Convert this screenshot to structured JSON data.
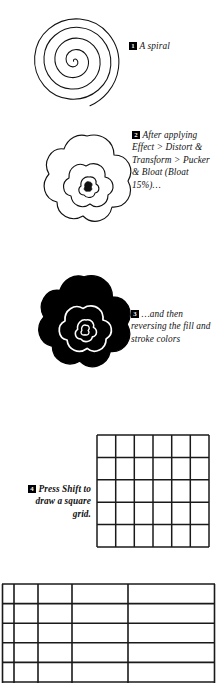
{
  "page": {
    "background_color": "#ffffff",
    "ink_color": "#111111",
    "width": 217,
    "height": 680
  },
  "figures": [
    {
      "id": "figure-spiral",
      "name": "spiral-figure",
      "description": "open outlined spiral curve, black stroke on white",
      "fill": "none",
      "stroke": "#111111"
    },
    {
      "id": "figure-bloat",
      "name": "bloated-spiral-figure",
      "description": "spiral after Pucker & Bloat effect, flower-like outline, white fill with black stroke",
      "fill": "#ffffff",
      "stroke": "#111111"
    },
    {
      "id": "figure-reversed",
      "name": "reversed-colors-figure",
      "description": "same bloated shape with fill and stroke colors reversed, black fill with white stroke",
      "fill": "#000000",
      "stroke": "#ffffff"
    },
    {
      "id": "figure-square-grid",
      "name": "square-grid-figure",
      "description": "square grid drawn with Shift held",
      "columns": 6,
      "rows": 5,
      "stroke": "#1a1a1a"
    },
    {
      "id": "figure-wide-grid",
      "name": "wide-grid-figure",
      "description": "non-square stretched grid with unequal column widths",
      "columns": 5,
      "rows": 5,
      "column_ratios": [
        12,
        24,
        34,
        56,
        87
      ],
      "stroke": "#1a1a1a"
    }
  ],
  "captions": [
    {
      "number": "1",
      "text": "A spiral",
      "style": "italic"
    },
    {
      "number": "2",
      "text": "After applying Effect > Distort & Transform > Pucker & Bloat (Bloat 15%)…",
      "style": "italic"
    },
    {
      "number": "3",
      "text": "…and then reversing the fill and stroke colors",
      "style": "italic"
    },
    {
      "number": "4",
      "text": "Press Shift to draw a square grid.",
      "style": "bold-italic-right"
    }
  ]
}
